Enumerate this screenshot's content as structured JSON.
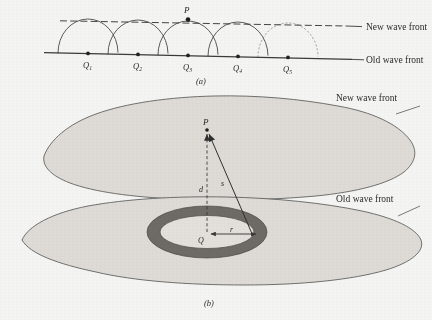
{
  "figure": {
    "background_color": "#f4f4f2",
    "ink_color": "#3a3a3a",
    "panels": [
      {
        "id": "a",
        "label": "(a)"
      },
      {
        "id": "b",
        "label": "(b)"
      }
    ]
  },
  "panel_a": {
    "caption": "(a)",
    "new_wavefront_label": "New wave front",
    "old_wavefront_label": "Old wave front",
    "point_p_label": "P",
    "sources": [
      {
        "label": "Q",
        "subscript": "1",
        "x": 88,
        "y": 53,
        "radius": 30
      },
      {
        "label": "Q",
        "subscript": "2",
        "x": 138,
        "y": 54,
        "radius": 30
      },
      {
        "label": "Q",
        "subscript": "3",
        "x": 188,
        "y": 55,
        "radius": 30
      },
      {
        "label": "Q",
        "subscript": "4",
        "x": 238,
        "y": 56,
        "radius": 30
      },
      {
        "label": "Q",
        "subscript": "5",
        "x": 288,
        "y": 57,
        "radius": 30
      }
    ],
    "point_p": {
      "x": 188,
      "y": 19
    }
  },
  "panel_b": {
    "caption": "(b)",
    "new_wavefront_label": "New wave front",
    "old_wavefront_label": "Old wave front",
    "point_p_label": "P",
    "source_q_label": "Q",
    "distance_d_label": "d",
    "distance_s_label": "s",
    "radius_r_label": "r",
    "ring_fill_color": "#6e6a66",
    "blob_fill_color": "#dedbd6",
    "point_p": {
      "x": 207,
      "y": 126
    },
    "source_q": {
      "x": 207,
      "y": 236
    },
    "ring": {
      "cx": 207,
      "cy": 232,
      "rx": 60,
      "ry": 26,
      "thickness": 11
    }
  }
}
